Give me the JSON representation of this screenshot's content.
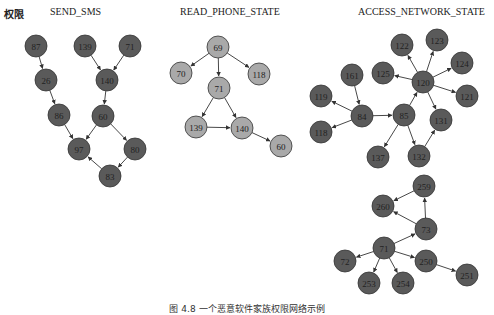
{
  "header": {
    "row_label": "权限",
    "groups": [
      "SEND_SMS",
      "READ_PHONE_STATE",
      "ACCESS_NETWORK_STATE"
    ]
  },
  "colors": {
    "dark_node": "#5a5a5a",
    "light_node": "#a9a9a9",
    "node_stroke": "#333333",
    "edge": "#333333"
  },
  "graphs": [
    {
      "name": "SEND_SMS",
      "style": "dark",
      "nodes": [
        {
          "id": "87",
          "x": 36,
          "y": 46
        },
        {
          "id": "139",
          "x": 85,
          "y": 46
        },
        {
          "id": "71",
          "x": 130,
          "y": 46
        },
        {
          "id": "26",
          "x": 46,
          "y": 80
        },
        {
          "id": "140",
          "x": 107,
          "y": 80
        },
        {
          "id": "86",
          "x": 59,
          "y": 115
        },
        {
          "id": "60",
          "x": 103,
          "y": 116
        },
        {
          "id": "97",
          "x": 79,
          "y": 149
        },
        {
          "id": "80",
          "x": 135,
          "y": 149
        },
        {
          "id": "83",
          "x": 110,
          "y": 176
        }
      ],
      "edges": [
        [
          "87",
          "26"
        ],
        [
          "26",
          "86"
        ],
        [
          "86",
          "97"
        ],
        [
          "139",
          "140"
        ],
        [
          "71",
          "140"
        ],
        [
          "140",
          "60"
        ],
        [
          "60",
          "97"
        ],
        [
          "60",
          "80"
        ],
        [
          "80",
          "83"
        ],
        [
          "83",
          "97"
        ]
      ]
    },
    {
      "name": "READ_PHONE_STATE",
      "style": "light",
      "nodes": [
        {
          "id": "69",
          "x": 218,
          "y": 47
        },
        {
          "id": "70",
          "x": 181,
          "y": 73
        },
        {
          "id": "118",
          "x": 259,
          "y": 74
        },
        {
          "id": "71",
          "x": 219,
          "y": 88
        },
        {
          "id": "139",
          "x": 196,
          "y": 127
        },
        {
          "id": "140",
          "x": 242,
          "y": 128
        },
        {
          "id": "60",
          "x": 281,
          "y": 146
        }
      ],
      "edges": [
        [
          "69",
          "70"
        ],
        [
          "69",
          "71"
        ],
        [
          "69",
          "118"
        ],
        [
          "71",
          "139"
        ],
        [
          "71",
          "140"
        ],
        [
          "139",
          "140"
        ],
        [
          "140",
          "60"
        ]
      ]
    },
    {
      "name": "ACCESS_NETWORK_STATE",
      "style": "dark",
      "nodes": [
        {
          "id": "122",
          "x": 402,
          "y": 45
        },
        {
          "id": "123",
          "x": 437,
          "y": 40
        },
        {
          "id": "124",
          "x": 462,
          "y": 63
        },
        {
          "id": "125",
          "x": 383,
          "y": 73
        },
        {
          "id": "120",
          "x": 423,
          "y": 82
        },
        {
          "id": "121",
          "x": 467,
          "y": 96
        },
        {
          "id": "161",
          "x": 352,
          "y": 75
        },
        {
          "id": "119",
          "x": 321,
          "y": 96
        },
        {
          "id": "84",
          "x": 362,
          "y": 116
        },
        {
          "id": "85",
          "x": 404,
          "y": 115
        },
        {
          "id": "131",
          "x": 441,
          "y": 120
        },
        {
          "id": "118",
          "x": 321,
          "y": 132
        },
        {
          "id": "137",
          "x": 378,
          "y": 157
        },
        {
          "id": "132",
          "x": 419,
          "y": 156
        },
        {
          "id": "259",
          "x": 424,
          "y": 186
        },
        {
          "id": "260",
          "x": 383,
          "y": 206
        },
        {
          "id": "73",
          "x": 426,
          "y": 229
        },
        {
          "id": "71",
          "x": 384,
          "y": 248
        },
        {
          "id": "72",
          "x": 345,
          "y": 261
        },
        {
          "id": "250",
          "x": 426,
          "y": 261
        },
        {
          "id": "251",
          "x": 467,
          "y": 275
        },
        {
          "id": "253",
          "x": 369,
          "y": 283
        },
        {
          "id": "254",
          "x": 403,
          "y": 283
        }
      ],
      "edges": [
        [
          "120",
          "122"
        ],
        [
          "120",
          "123"
        ],
        [
          "120",
          "124"
        ],
        [
          "120",
          "125"
        ],
        [
          "120",
          "121"
        ],
        [
          "120",
          "131"
        ],
        [
          "161",
          "84"
        ],
        [
          "84",
          "119"
        ],
        [
          "84",
          "118"
        ],
        [
          "84",
          "85"
        ],
        [
          "85",
          "120"
        ],
        [
          "85",
          "137"
        ],
        [
          "85",
          "132"
        ],
        [
          "132",
          "131"
        ],
        [
          "259",
          "260"
        ],
        [
          "73",
          "259"
        ],
        [
          "73",
          "260"
        ],
        [
          "71",
          "73"
        ],
        [
          "71",
          "72"
        ],
        [
          "71",
          "250"
        ],
        [
          "71",
          "253"
        ],
        [
          "71",
          "254"
        ],
        [
          "250",
          "251"
        ]
      ]
    }
  ],
  "caption": "图 4.8    一个恶意软件家族权限网络示例"
}
